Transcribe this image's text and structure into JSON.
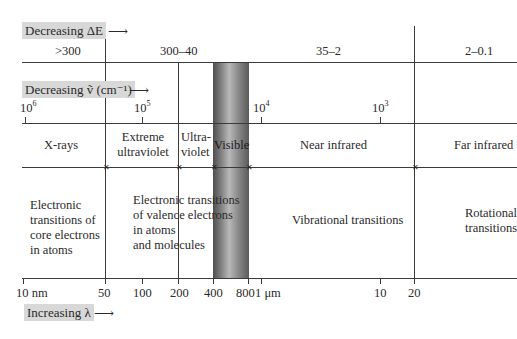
{
  "axes": {
    "energy": {
      "label": "Decreasing ΔE",
      "arrow": "⟶",
      "unit_note": "",
      "ranges": [
        ">300",
        "300–40",
        "35–2",
        "2–0.1"
      ]
    },
    "wavenumber": {
      "label": "Decreasing ṽ (cm⁻¹)",
      "arrow": "⟶",
      "ticks": [
        {
          "base": "10",
          "exp": "6"
        },
        {
          "base": "10",
          "exp": "5"
        },
        {
          "base": "10",
          "exp": "4"
        },
        {
          "base": "10",
          "exp": "3"
        }
      ]
    },
    "wavelength": {
      "label": "Increasing λ",
      "arrow": "⟶",
      "ticks": [
        "10 nm",
        "50",
        "100",
        "200",
        "400",
        "800",
        "1 μm",
        "10",
        "20"
      ]
    }
  },
  "regions": [
    "X-rays",
    "Extreme ultraviolet",
    "Ultra-violet",
    "Visible",
    "Near infrared",
    "Far infrared"
  ],
  "region_lines": {
    "extreme_uv": [
      "Extreme",
      "ultraviolet"
    ],
    "uv": [
      "Ultra-",
      "violet"
    ]
  },
  "transitions": {
    "core": [
      "Electronic",
      "transitions of",
      "core electrons",
      "in atoms"
    ],
    "valence": [
      "Electronic transitions",
      "of valence electrons",
      "in atoms",
      "and molecules"
    ],
    "vibrational": "Vibrational transitions",
    "rotational": [
      "Rotational",
      "transitions"
    ]
  },
  "colors": {
    "label_box": "#d8d8d8",
    "line": "#3a3a3a",
    "visible_band_dark": "#4e4e4e",
    "visible_band_light": "#b8b8b8"
  }
}
